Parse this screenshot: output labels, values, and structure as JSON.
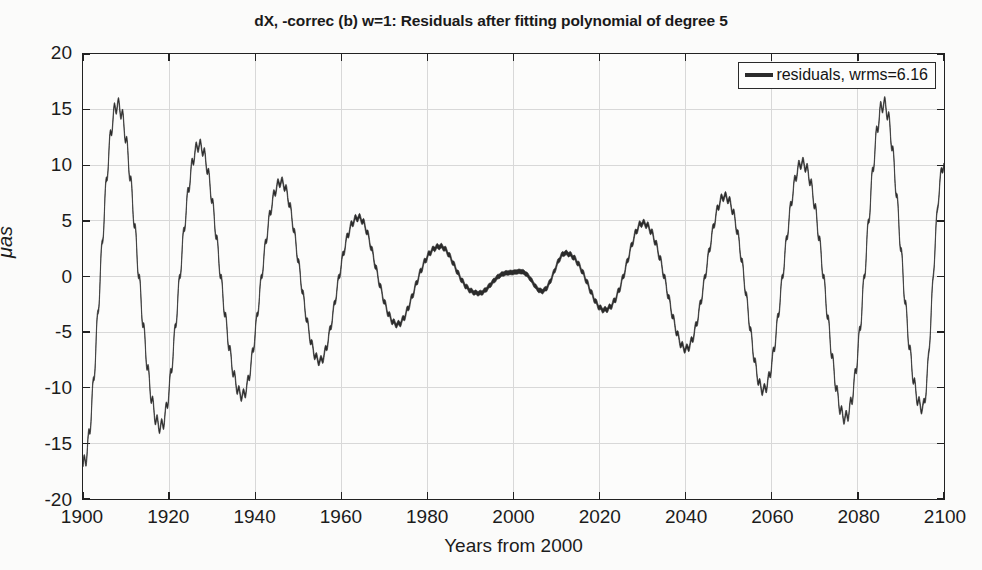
{
  "chart_data": {
    "type": "line",
    "title": "dX, -correc (b) w=1: Residuals after fitting polynomial of degree 5",
    "xlabel": "Years from 2000",
    "ylabel": "μas",
    "xlim": [
      1900,
      2100
    ],
    "ylim": [
      -20,
      20
    ],
    "grid": true,
    "xticks": [
      1900,
      1920,
      1940,
      1960,
      1980,
      2000,
      2020,
      2040,
      2060,
      2080,
      2100
    ],
    "yticks": [
      20,
      15,
      10,
      5,
      0,
      -5,
      -10,
      -15,
      -20
    ],
    "xtick_labels": [
      "1900",
      "1920",
      "1940",
      "1960",
      "1980",
      "2000",
      "2020",
      "2040",
      "2060",
      "2080",
      "2100"
    ],
    "ytick_labels": [
      "20",
      "15",
      "10",
      "5",
      "0",
      "-5",
      "-10",
      "-15",
      "-20"
    ],
    "legend": {
      "position": "top-right",
      "entries": [
        {
          "label": "residuals, wrms=6.16",
          "color": "#2b2b2b",
          "marker": "line"
        }
      ]
    },
    "series": [
      {
        "name": "residuals, wrms=6.16",
        "color": "#2b2b2b",
        "line_width": 4.6,
        "description": "Amplitude-modulated ~18.6-year oscillation; envelope collapses near year 2000 and grows toward both ends",
        "envelope_nodes": [
          {
            "year": 1900,
            "amplitude": 16.9
          },
          {
            "year": 1908,
            "amplitude": 15.4
          },
          {
            "year": 1918,
            "amplitude": 13.5
          },
          {
            "year": 1927,
            "amplitude": 11.8
          },
          {
            "year": 1937,
            "amplitude": 10.7
          },
          {
            "year": 1946,
            "amplitude": 8.5
          },
          {
            "year": 1955,
            "amplitude": 7.6
          },
          {
            "year": 1964,
            "amplitude": 5.3
          },
          {
            "year": 1973,
            "amplitude": 4.3
          },
          {
            "year": 1983,
            "amplitude": 2.7
          },
          {
            "year": 1992,
            "amplitude": 1.5
          },
          {
            "year": 2000,
            "amplitude": 0.4
          },
          {
            "year": 2012,
            "amplitude": 2.1
          },
          {
            "year": 2021,
            "amplitude": 3.0
          },
          {
            "year": 2030,
            "amplitude": 4.8
          },
          {
            "year": 2040,
            "amplitude": 6.5
          },
          {
            "year": 2049,
            "amplitude": 7.2
          },
          {
            "year": 2058,
            "amplitude": 10.2
          },
          {
            "year": 2067,
            "amplitude": 10.2
          },
          {
            "year": 2077,
            "amplitude": 12.7
          },
          {
            "year": 2086,
            "amplitude": 15.5
          },
          {
            "year": 2095,
            "amplitude": 11.8
          },
          {
            "year": 2100,
            "amplitude": 10.0
          }
        ],
        "extrema": [
          {
            "year": 1900,
            "value": -16.9
          },
          {
            "year": 1908,
            "value": 15.4
          },
          {
            "year": 1918,
            "value": -13.5
          },
          {
            "year": 1927,
            "value": 11.8
          },
          {
            "year": 1937,
            "value": -10.7
          },
          {
            "year": 1946,
            "value": 8.5
          },
          {
            "year": 1955,
            "value": -7.6
          },
          {
            "year": 1964,
            "value": 5.3
          },
          {
            "year": 1973,
            "value": -4.3
          },
          {
            "year": 1983,
            "value": 2.7
          },
          {
            "year": 1992,
            "value": -1.5
          },
          {
            "year": 2001,
            "value": 0.4
          },
          {
            "year": 2006,
            "value": -0.2
          },
          {
            "year": 2012,
            "value": 2.1
          },
          {
            "year": 2021,
            "value": -3.0
          },
          {
            "year": 2030,
            "value": 4.8
          },
          {
            "year": 2040,
            "value": -6.5
          },
          {
            "year": 2049,
            "value": 7.2
          },
          {
            "year": 2058,
            "value": -10.2
          },
          {
            "year": 2067,
            "value": 10.2
          },
          {
            "year": 2077,
            "value": -12.7
          },
          {
            "year": 2086,
            "value": 15.5
          },
          {
            "year": 2095,
            "value": -11.8
          },
          {
            "year": 2100,
            "value": 10.0
          }
        ],
        "period_years": 18.6,
        "ripple_period_years": 1.0,
        "ripple_amplitude_frac": 0.055
      }
    ],
    "wrms": 6.16,
    "colors": {
      "line": "#2b2b2b",
      "grid": "#d8d8d8",
      "axes": "#222222",
      "background": "#fcfcfb",
      "figure_background": "#fbfbfa",
      "text": "#1c1c1c"
    }
  }
}
